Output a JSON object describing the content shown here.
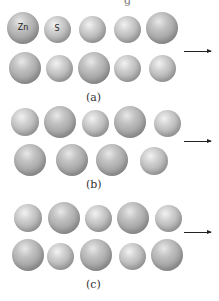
{
  "figure": {
    "top_fragment": "g",
    "panels": [
      {
        "label": "(a)",
        "label_pos": [
          86,
          91
        ],
        "arrow": {
          "x": 184,
          "y": 51,
          "w": 27
        },
        "spheres": [
          {
            "x": 23,
            "y": 28,
            "d": 32,
            "big": true,
            "text": "Zn"
          },
          {
            "x": 57,
            "y": 29,
            "d": 27,
            "big": false,
            "text": "S"
          },
          {
            "x": 92,
            "y": 29,
            "d": 27,
            "big": false,
            "text": ""
          },
          {
            "x": 127,
            "y": 29,
            "d": 27,
            "big": false,
            "text": ""
          },
          {
            "x": 162,
            "y": 28,
            "d": 32,
            "big": true,
            "text": ""
          },
          {
            "x": 25,
            "y": 68,
            "d": 32,
            "big": true,
            "text": ""
          },
          {
            "x": 59,
            "y": 68,
            "d": 27,
            "big": false,
            "text": ""
          },
          {
            "x": 94,
            "y": 68,
            "d": 32,
            "big": true,
            "text": ""
          },
          {
            "x": 127,
            "y": 68,
            "d": 27,
            "big": false,
            "text": ""
          },
          {
            "x": 162,
            "y": 68,
            "d": 27,
            "big": false,
            "text": ""
          }
        ]
      },
      {
        "label": "(b)",
        "label_pos": [
          86,
          178
        ],
        "arrow": {
          "x": 184,
          "y": 141,
          "w": 27
        },
        "spheres": [
          {
            "x": 25,
            "y": 122,
            "d": 28,
            "big": false,
            "text": ""
          },
          {
            "x": 60,
            "y": 122,
            "d": 32,
            "big": true,
            "text": ""
          },
          {
            "x": 95,
            "y": 123,
            "d": 27,
            "big": false,
            "text": ""
          },
          {
            "x": 130,
            "y": 122,
            "d": 32,
            "big": true,
            "text": ""
          },
          {
            "x": 167,
            "y": 123,
            "d": 27,
            "big": false,
            "text": ""
          },
          {
            "x": 30,
            "y": 160,
            "d": 32,
            "big": true,
            "text": ""
          },
          {
            "x": 72,
            "y": 160,
            "d": 32,
            "big": true,
            "text": ""
          },
          {
            "x": 112,
            "y": 160,
            "d": 32,
            "big": true,
            "text": ""
          },
          {
            "x": 154,
            "y": 161,
            "d": 28,
            "big": false,
            "text": ""
          }
        ]
      },
      {
        "label": "(c)",
        "label_pos": [
          86,
          278
        ],
        "arrow": {
          "x": 184,
          "y": 232,
          "w": 27
        },
        "spheres": [
          {
            "x": 28,
            "y": 218,
            "d": 28,
            "big": false,
            "text": ""
          },
          {
            "x": 64,
            "y": 218,
            "d": 32,
            "big": true,
            "text": ""
          },
          {
            "x": 98,
            "y": 218,
            "d": 27,
            "big": false,
            "text": ""
          },
          {
            "x": 133,
            "y": 218,
            "d": 32,
            "big": true,
            "text": ""
          },
          {
            "x": 168,
            "y": 218,
            "d": 27,
            "big": false,
            "text": ""
          },
          {
            "x": 28,
            "y": 255,
            "d": 32,
            "big": true,
            "text": ""
          },
          {
            "x": 60,
            "y": 256,
            "d": 27,
            "big": false,
            "text": ""
          },
          {
            "x": 96,
            "y": 255,
            "d": 32,
            "big": true,
            "text": ""
          },
          {
            "x": 132,
            "y": 256,
            "d": 27,
            "big": false,
            "text": ""
          },
          {
            "x": 167,
            "y": 255,
            "d": 32,
            "big": true,
            "text": ""
          }
        ]
      }
    ]
  }
}
